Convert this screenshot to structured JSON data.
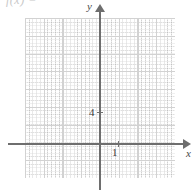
{
  "figure": {
    "type": "coordinate-grid",
    "width": 196,
    "height": 194,
    "background_color": "#ffffff",
    "formula_fragment": "f(x) ="
  },
  "axes": {
    "x": {
      "label": "x",
      "arrow": "right-arrow-icon",
      "color": "#6e6e6e",
      "tick_labels": [
        "1"
      ]
    },
    "y": {
      "label": "y",
      "arrow": "up-arrow-icon",
      "color": "#6e6e6e",
      "tick_labels": [
        "4"
      ]
    }
  },
  "grid": {
    "major_color": "#d2d2d2",
    "minor_color": "#aaaaaa",
    "style": "dotted",
    "major_cols": 8,
    "major_rows": 9
  },
  "chart_data": {
    "type": "scatter",
    "title": "",
    "subtitle": "",
    "xlabel": "x",
    "ylabel": "y",
    "x": [],
    "y": [],
    "series": [],
    "xlim": [
      -4,
      4
    ],
    "ylim": [
      -2,
      8
    ],
    "x_ticks": [
      1
    ],
    "x_tick_labels": [
      "1"
    ],
    "y_ticks": [
      4
    ],
    "y_tick_labels": [
      "4"
    ],
    "grid": true,
    "legend": "none",
    "annotations": [
      "f(x) ="
    ],
    "note": "Empty coordinate grid with labeled x-axis tick at 1 and y-axis tick at 4; no data plotted."
  }
}
